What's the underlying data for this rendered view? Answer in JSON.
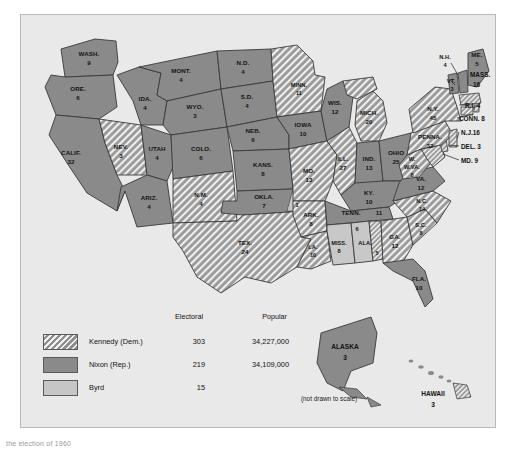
{
  "map": {
    "title": "1960 United States presidential election electoral vote map",
    "not_to_scale_note": "(not drawn to scale)",
    "bottom_caption": "the election of 1960"
  },
  "legend": {
    "header": {
      "electoral": "Electoral",
      "popular": "Popular"
    },
    "rows": [
      {
        "pattern": "hatched",
        "name": "Kennedy (Dem.)",
        "electoral": "303",
        "popular": "34,227,000"
      },
      {
        "pattern": "solid-gray",
        "name": "Nixon (Rep.)",
        "electoral": "219",
        "popular": "34,109,000"
      },
      {
        "pattern": "light-gray",
        "name": "Byrd",
        "electoral": "15",
        "popular": ""
      }
    ]
  },
  "states": [
    {
      "abbr": "WASH.",
      "votes": "9",
      "winner": "nixon"
    },
    {
      "abbr": "ORE.",
      "votes": "6",
      "winner": "nixon"
    },
    {
      "abbr": "CALIF.",
      "votes": "32",
      "winner": "nixon"
    },
    {
      "abbr": "NEV.",
      "votes": "3",
      "winner": "kennedy"
    },
    {
      "abbr": "IDA.",
      "votes": "4",
      "winner": "nixon"
    },
    {
      "abbr": "MONT.",
      "votes": "4",
      "winner": "nixon"
    },
    {
      "abbr": "WYO.",
      "votes": "3",
      "winner": "nixon"
    },
    {
      "abbr": "UTAH",
      "votes": "4",
      "winner": "nixon"
    },
    {
      "abbr": "ARIZ.",
      "votes": "4",
      "winner": "nixon"
    },
    {
      "abbr": "COLO.",
      "votes": "6",
      "winner": "nixon"
    },
    {
      "abbr": "N.M.",
      "votes": "4",
      "winner": "kennedy"
    },
    {
      "abbr": "N.D.",
      "votes": "4",
      "winner": "nixon"
    },
    {
      "abbr": "S.D.",
      "votes": "4",
      "winner": "nixon"
    },
    {
      "abbr": "NEB.",
      "votes": "6",
      "winner": "nixon"
    },
    {
      "abbr": "KANS.",
      "votes": "8",
      "winner": "nixon"
    },
    {
      "abbr": "OKLA.",
      "votes": "7",
      "winner": "nixon"
    },
    {
      "abbr": "OKLA-BYRD",
      "votes": "1",
      "winner": "byrd"
    },
    {
      "abbr": "TEX.",
      "votes": "24",
      "winner": "kennedy"
    },
    {
      "abbr": "MINN.",
      "votes": "11",
      "winner": "kennedy"
    },
    {
      "abbr": "IOWA",
      "votes": "10",
      "winner": "nixon"
    },
    {
      "abbr": "MO.",
      "votes": "13",
      "winner": "kennedy"
    },
    {
      "abbr": "ARK.",
      "votes": "8",
      "winner": "kennedy"
    },
    {
      "abbr": "LA.",
      "votes": "10",
      "winner": "kennedy"
    },
    {
      "abbr": "WIS.",
      "votes": "12",
      "winner": "nixon"
    },
    {
      "abbr": "ILL.",
      "votes": "27",
      "winner": "kennedy"
    },
    {
      "abbr": "MICH.",
      "votes": "20",
      "winner": "kennedy"
    },
    {
      "abbr": "IND.",
      "votes": "13",
      "winner": "nixon"
    },
    {
      "abbr": "OHIO",
      "votes": "25",
      "winner": "nixon"
    },
    {
      "abbr": "KY.",
      "votes": "10",
      "winner": "nixon"
    },
    {
      "abbr": "TENN.",
      "votes": "11",
      "winner": "nixon"
    },
    {
      "abbr": "MISS.",
      "votes": "8",
      "winner": "byrd"
    },
    {
      "abbr": "ALA.",
      "votes": "6",
      "winner": "byrd"
    },
    {
      "abbr": "ALA-KEN",
      "votes": "5",
      "winner": "kennedy"
    },
    {
      "abbr": "GA.",
      "votes": "12",
      "winner": "kennedy"
    },
    {
      "abbr": "FLA.",
      "votes": "10",
      "winner": "nixon"
    },
    {
      "abbr": "S.C.",
      "votes": "8",
      "winner": "kennedy"
    },
    {
      "abbr": "N.C.",
      "votes": "14",
      "winner": "kennedy"
    },
    {
      "abbr": "VA.",
      "votes": "12",
      "winner": "nixon"
    },
    {
      "abbr": "W.VA.",
      "votes": "8",
      "winner": "kennedy"
    },
    {
      "abbr": "PENNA.",
      "votes": "32",
      "winner": "kennedy"
    },
    {
      "abbr": "N.Y.",
      "votes": "45",
      "winner": "kennedy"
    },
    {
      "abbr": "VT.",
      "votes": "3",
      "winner": "nixon"
    },
    {
      "abbr": "N.H.",
      "votes": "4",
      "winner": "nixon"
    },
    {
      "abbr": "ME.",
      "votes": "5",
      "winner": "nixon"
    },
    {
      "abbr": "MASS.",
      "votes": "16",
      "winner": "kennedy"
    },
    {
      "abbr": "R.I.",
      "votes": "4",
      "winner": "kennedy"
    },
    {
      "abbr": "CONN.",
      "votes": "8",
      "winner": "kennedy"
    },
    {
      "abbr": "N.J.",
      "votes": "16",
      "winner": "kennedy"
    },
    {
      "abbr": "DEL.",
      "votes": "3",
      "winner": "kennedy"
    },
    {
      "abbr": "MD.",
      "votes": "9",
      "winner": "kennedy"
    },
    {
      "abbr": "ALASKA",
      "votes": "3",
      "winner": "nixon"
    },
    {
      "abbr": "HAWAII",
      "votes": "3",
      "winner": "kennedy"
    }
  ],
  "offshore_labels": {
    "alaska_name": "ALASKA",
    "alaska_votes": "3",
    "hawaii_name": "HAWAII",
    "hawaii_votes": "3"
  },
  "leader_labels": [
    {
      "text": "N.J.16"
    },
    {
      "text": "DEL. 3"
    },
    {
      "text": "MD. 9"
    },
    {
      "text": "MASS."
    },
    {
      "text": "16"
    },
    {
      "text": "R.I. 4"
    },
    {
      "text": "CONN. 8"
    }
  ],
  "colors": {
    "kennedy_hatch_base": "#8e8e8e",
    "nixon_fill": "#8a8a8a",
    "byrd_fill": "#c6c6c6",
    "ocean": "#e9e9e9",
    "border": "#3a3a3a"
  }
}
